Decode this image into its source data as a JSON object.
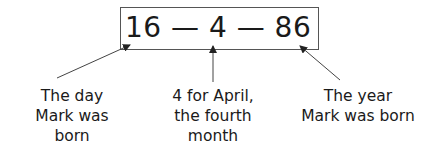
{
  "date": {
    "day": "16",
    "separator1": "—",
    "month": "4",
    "separator2": "—",
    "year": "86",
    "full_text": "16 — 4 — 86"
  },
  "labels": {
    "day": {
      "lines": [
        "The day",
        "Mark was",
        "born"
      ]
    },
    "month": {
      "lines": [
        "4 for April,",
        "the fourth",
        "month"
      ]
    },
    "year": {
      "lines": [
        "The year",
        "Mark was born"
      ]
    }
  },
  "arrows": [
    {
      "name": "arrow-to-day",
      "from": [
        57,
        78
      ],
      "to": [
        130,
        45
      ]
    },
    {
      "name": "arrow-to-month",
      "from": [
        213,
        82
      ],
      "to": [
        213,
        46
      ]
    },
    {
      "name": "arrow-to-year",
      "from": [
        340,
        80
      ],
      "to": [
        300,
        46
      ]
    }
  ],
  "colors": {
    "text": "#1a1a1a",
    "box_border": "#555555",
    "arrow": "#333333"
  }
}
